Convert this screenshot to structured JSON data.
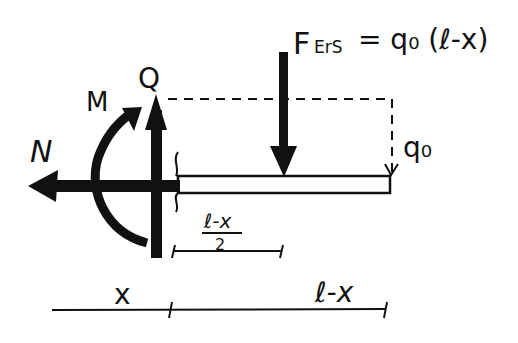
{
  "diagram": {
    "type": "free-body diagram of cut beam section",
    "labels": {
      "normal_force": "N",
      "moment": "M",
      "shear_force": "Q",
      "resultant_force": "F",
      "resultant_subscript": "ErS",
      "resultant_equation": "= q₀ (ℓ-x)",
      "distributed_load": "q₀",
      "half_length_numerator": "ℓ-x",
      "half_length_denominator": "2",
      "dim_left": "x",
      "dim_right": "ℓ-x"
    },
    "colors": {
      "ink": "#111111",
      "background": "#ffffff"
    }
  }
}
